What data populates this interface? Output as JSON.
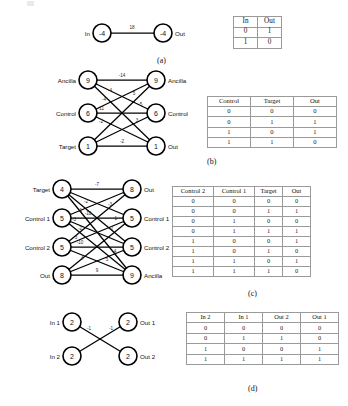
{
  "figure": {
    "panels": [
      {
        "key": "a",
        "caption": "(a)",
        "graph": {
          "nodes": [
            {
              "id": "in",
              "name": "In",
              "value": "-4"
            },
            {
              "id": "out",
              "name": "Out",
              "value": "-4"
            }
          ],
          "edges": [
            {
              "from": "in",
              "to": "out",
              "weight": "18"
            }
          ]
        },
        "table": {
          "headers": [
            "In",
            "Out"
          ],
          "rows": [
            [
              "0",
              "1"
            ],
            [
              "1",
              "0"
            ]
          ]
        }
      },
      {
        "key": "b",
        "caption": "(b)",
        "graph": {
          "nodes": [
            {
              "id": "la",
              "name": "Ancilla",
              "value": "9"
            },
            {
              "id": "lc",
              "name": "Control",
              "value": "6"
            },
            {
              "id": "lt",
              "name": "Target",
              "value": "1"
            },
            {
              "id": "ra",
              "name": "Ancilla",
              "value": "9"
            },
            {
              "id": "rc",
              "name": "Control",
              "value": "6"
            },
            {
              "id": "ro",
              "name": "Out",
              "value": "1"
            }
          ],
          "edges": [
            {
              "from": "la",
              "to": "ra",
              "weight": "-14"
            },
            {
              "from": "la",
              "to": "rc",
              "weight": "-4"
            },
            {
              "from": "la",
              "to": "ro",
              "weight": "-4"
            },
            {
              "from": "lc",
              "to": "ra",
              "weight": "5"
            },
            {
              "from": "lc",
              "to": "rc",
              "weight": "-11"
            },
            {
              "from": "lc",
              "to": "ro",
              "weight": "-2"
            },
            {
              "from": "lt",
              "to": "ra",
              "weight": "5"
            },
            {
              "from": "lt",
              "to": "rc",
              "weight": "3"
            },
            {
              "from": "lt",
              "to": "ro",
              "weight": "-2"
            }
          ]
        },
        "table": {
          "headers": [
            "Control",
            "Target",
            "Out"
          ],
          "rows": [
            [
              "0",
              "0",
              "0"
            ],
            [
              "0",
              "1",
              "1"
            ],
            [
              "1",
              "0",
              "1"
            ],
            [
              "1",
              "1",
              "0"
            ]
          ]
        }
      },
      {
        "key": "c",
        "caption": "(c)",
        "graph": {
          "nodes": [
            {
              "id": "lt",
              "name": "Target",
              "value": "4"
            },
            {
              "id": "lc1",
              "name": "Control 1",
              "value": "5"
            },
            {
              "id": "lc2",
              "name": "Control 2",
              "value": "5"
            },
            {
              "id": "lo",
              "name": "Out",
              "value": "8"
            },
            {
              "id": "ro",
              "name": "Out",
              "value": "8"
            },
            {
              "id": "rc1",
              "name": "Control 1",
              "value": "5"
            },
            {
              "id": "rc2",
              "name": "Control 2",
              "value": "5"
            },
            {
              "id": "ra",
              "name": "Ancilla",
              "value": "9"
            }
          ],
          "edges": [
            {
              "from": "lt",
              "to": "ro",
              "weight": "-7"
            },
            {
              "from": "lt",
              "to": "rc1",
              "weight": "-2"
            },
            {
              "from": "lt",
              "to": "rc2",
              "weight": "-1"
            },
            {
              "from": "lt",
              "to": "ra",
              "weight": "-3"
            },
            {
              "from": "lc1",
              "to": "rc1",
              "weight": "-10"
            },
            {
              "from": "lc1",
              "to": "rc2",
              "weight": "-2"
            },
            {
              "from": "lc1",
              "to": "ra",
              "weight": "3"
            },
            {
              "from": "lc1",
              "to": "ro",
              "weight": "-3"
            },
            {
              "from": "lc2",
              "to": "rc2",
              "weight": "-10"
            },
            {
              "from": "lc2",
              "to": "rc1",
              "weight": "-2"
            },
            {
              "from": "lc2",
              "to": "ra",
              "weight": "4"
            },
            {
              "from": "lc2",
              "to": "ro",
              "weight": "-1"
            },
            {
              "from": "lo",
              "to": "ra",
              "weight": "9"
            },
            {
              "from": "lo",
              "to": "rc1",
              "weight": "5"
            },
            {
              "from": "lo",
              "to": "rc2",
              "weight": "4"
            }
          ]
        },
        "table": {
          "headers": [
            "Control 2",
            "Control 1",
            "Target",
            "Out"
          ],
          "rows": [
            [
              "0",
              "0",
              "0",
              "0"
            ],
            [
              "0",
              "0",
              "1",
              "1"
            ],
            [
              "0",
              "1",
              "0",
              "0"
            ],
            [
              "0",
              "1",
              "1",
              "1"
            ],
            [
              "1",
              "0",
              "0",
              "1"
            ],
            [
              "1",
              "0",
              "1",
              "0"
            ],
            [
              "1",
              "1",
              "0",
              "1"
            ],
            [
              "1",
              "1",
              "1",
              "0"
            ]
          ]
        }
      },
      {
        "key": "d",
        "caption": "(d)",
        "graph": {
          "nodes": [
            {
              "id": "i1",
              "name": "In 1",
              "value": "2"
            },
            {
              "id": "i2",
              "name": "In 2",
              "value": "2"
            },
            {
              "id": "o1",
              "name": "Out 1",
              "value": "2"
            },
            {
              "id": "o2",
              "name": "Out 2",
              "value": "2"
            }
          ],
          "edges": [
            {
              "from": "i1",
              "to": "o2",
              "weight": "-1"
            },
            {
              "from": "i2",
              "to": "o1",
              "weight": "-1"
            }
          ]
        },
        "table": {
          "headers": [
            "In 2",
            "In 1",
            "Out 2",
            "Out 1"
          ],
          "rows": [
            [
              "0",
              "0",
              "0",
              "0"
            ],
            [
              "0",
              "1",
              "1",
              "0"
            ],
            [
              "1",
              "0",
              "0",
              "1"
            ],
            [
              "1",
              "1",
              "1",
              "1"
            ]
          ]
        }
      }
    ]
  },
  "colors": {
    "node_stroke": "#000000",
    "node_fill": "#ffffff",
    "edge": "#000000",
    "table_border": "#9a9a9a",
    "text": "#111111",
    "background": "#ffffff"
  }
}
